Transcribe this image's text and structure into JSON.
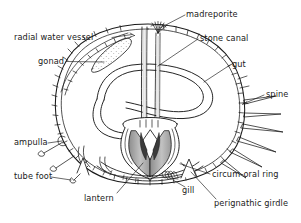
{
  "figure": {
    "organism": "sea urchin",
    "view": "vertical section",
    "background_color": "#ffffff",
    "ink_color": "#1a1a1a",
    "shading_color": "#b9b9b9",
    "label_font_size_px": 8.2
  },
  "labels": [
    {
      "id": "radial-water-vessel",
      "text": "radial water vessel",
      "x": 14,
      "y": 33,
      "anchor": "start",
      "leader": true
    },
    {
      "id": "gonad",
      "text": "gonad",
      "x": 38,
      "y": 61,
      "anchor": "start",
      "leader": true
    },
    {
      "id": "ampulla",
      "text": "ampulla",
      "x": 14,
      "y": 141,
      "anchor": "start",
      "leader": true
    },
    {
      "id": "tube-foot",
      "text": "tube foot",
      "x": 14,
      "y": 174,
      "anchor": "start",
      "leader": true
    },
    {
      "id": "lantern",
      "text": "lantern",
      "x": 84,
      "y": 196,
      "anchor": "start",
      "leader": true
    },
    {
      "id": "madreporite",
      "text": "madreporite",
      "x": 186,
      "y": 11,
      "anchor": "start",
      "leader": true
    },
    {
      "id": "stone-canal",
      "text": "stone canal",
      "x": 200,
      "y": 36,
      "anchor": "start",
      "leader": true
    },
    {
      "id": "gut",
      "text": "gut",
      "x": 232,
      "y": 62,
      "anchor": "start",
      "leader": true
    },
    {
      "id": "spine",
      "text": "spine",
      "x": 266,
      "y": 92,
      "anchor": "start",
      "leader": true
    },
    {
      "id": "circum-oral-ring",
      "text": "circum-oral ring",
      "x": 212,
      "y": 172,
      "anchor": "start",
      "leader": true
    },
    {
      "id": "gill",
      "text": "gill",
      "x": 182,
      "y": 190,
      "anchor": "start",
      "leader": true
    },
    {
      "id": "perignathic-girdle",
      "text": "perignathic girdle",
      "x": 214,
      "y": 201,
      "anchor": "start",
      "leader": true
    }
  ],
  "structures": [
    {
      "id": "test-wall",
      "name": "test (body wall) with plate hatching"
    },
    {
      "id": "gonad-body",
      "name": "gonad (stippled elongate sac)"
    },
    {
      "id": "gut-loop",
      "name": "gut (coiled double-walled tube)"
    },
    {
      "id": "esophagus",
      "name": "esophagus / stone canal descending tubes"
    },
    {
      "id": "aristotles-lantern",
      "name": "Aristotle's lantern with teeth"
    },
    {
      "id": "spines",
      "name": "spines projecting from test"
    },
    {
      "id": "tube-feet",
      "name": "tube feet with ampullae"
    },
    {
      "id": "gill-tuft",
      "name": "gill (peristomial gill tuft)"
    },
    {
      "id": "perignathic-girdle-process",
      "name": "perignathic girdle process"
    }
  ]
}
